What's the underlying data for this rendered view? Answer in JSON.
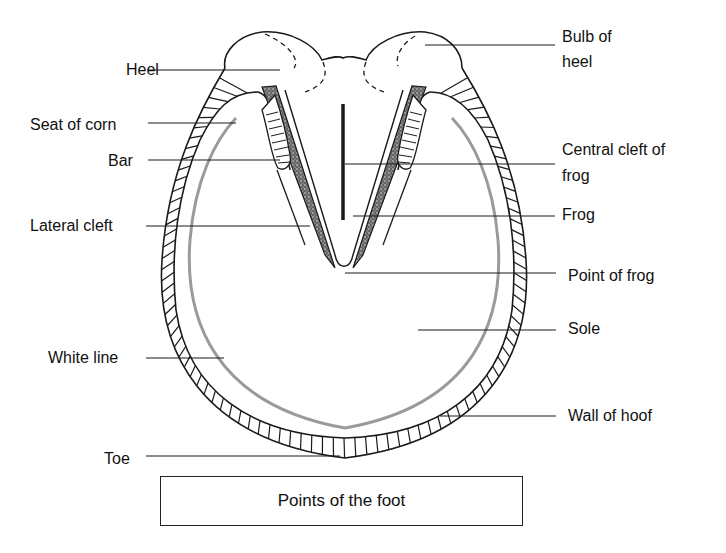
{
  "figure": {
    "caption": "Points of the foot",
    "labels": {
      "heel": "Heel",
      "seat_of_corn": "Seat of corn",
      "bar": "Bar",
      "lateral_cleft": "Lateral cleft",
      "white_line": "White line",
      "toe": "Toe",
      "bulb_of_heel_line1": "Bulb of",
      "bulb_of_heel_line2": "heel",
      "central_cleft_line1": "Central cleft of",
      "central_cleft_line2": "frog",
      "frog": "Frog",
      "point_of_frog": "Point of frog",
      "sole": "Sole",
      "wall_of_hoof": "Wall of hoof"
    },
    "colors": {
      "stroke": "#1a1a1a",
      "white_line_gray": "#9a9a9a",
      "background": "#ffffff"
    }
  }
}
